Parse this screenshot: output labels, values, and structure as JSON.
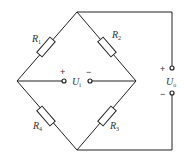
{
  "diagram": {
    "type": "wheatstone-bridge",
    "resistors": [
      {
        "id": "R1",
        "label": "R",
        "sub": "1"
      },
      {
        "id": "R2",
        "label": "R",
        "sub": "2"
      },
      {
        "id": "R3",
        "label": "R",
        "sub": "3"
      },
      {
        "id": "R4",
        "label": "R",
        "sub": "4"
      }
    ],
    "input": {
      "label": "U",
      "sub": "i",
      "plus": "+",
      "minus": "−"
    },
    "output": {
      "label": "U",
      "sub": "o",
      "plus": "+",
      "minus": "−"
    },
    "colors": {
      "line": "#222222",
      "text": "#333333",
      "background": "#ffffff"
    }
  }
}
